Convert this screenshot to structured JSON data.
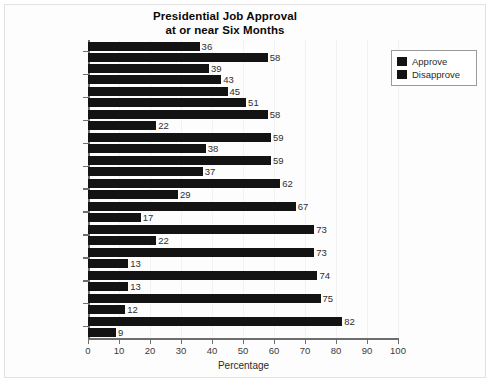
{
  "chart_data": {
    "type": "bar",
    "orientation": "horizontal",
    "title": "Presidential Job Approval\nat or near Six Months",
    "title_line1": "Presidential Job Approval",
    "title_line2": "at or near Six Months",
    "xlabel": "Percentage",
    "ylabel": "",
    "xlim": [
      0,
      100
    ],
    "xticks": [
      0,
      10,
      20,
      30,
      40,
      50,
      60,
      70,
      80,
      90,
      100
    ],
    "xticklabels": [
      "0",
      "10",
      "20",
      "30",
      "40",
      "50",
      "60",
      "70",
      "80",
      "90",
      "100"
    ],
    "grid": false,
    "legend_position": "upper right",
    "bar_color": "#131313",
    "categories": [
      "Trump",
      "Ford",
      "Clinton",
      "Nixon",
      "G. W. Bush",
      "Obama",
      "Reagan",
      "Carter",
      "G. H. W. Bush",
      "Eisenhower",
      "Johnson",
      "Kennedy",
      "Truman"
    ],
    "series": [
      {
        "name": "Approve",
        "color": "#131313",
        "values": [
          36,
          39,
          45,
          58,
          59,
          59,
          62,
          67,
          73,
          73,
          74,
          75,
          82
        ]
      },
      {
        "name": "Disapprove",
        "color": "#131313",
        "values": [
          58,
          43,
          51,
          22,
          38,
          37,
          29,
          17,
          22,
          13,
          13,
          12,
          9
        ]
      }
    ]
  },
  "legend": {
    "items": [
      {
        "label": "Approve"
      },
      {
        "label": "Disapprove"
      }
    ]
  }
}
